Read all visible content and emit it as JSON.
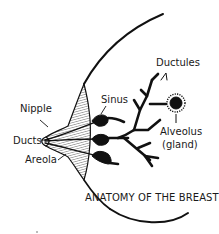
{
  "title": "ANATOMY OF THE BREAST",
  "labels": {
    "nipple": "Nipple",
    "ducts": "Ducts",
    "areola": "Areola",
    "sinus": "Sinus",
    "ductules": "Ductules",
    "alveolus_line1": "Alveolus",
    "alveolus_line2": "(gland)"
  },
  "colors": {
    "ink": "#111111",
    "background": "#ffffff"
  }
}
